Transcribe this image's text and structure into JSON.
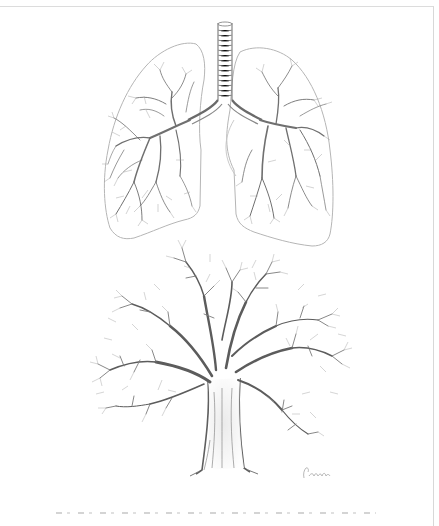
{
  "illustration": {
    "subjects": [
      "lungs",
      "tree"
    ],
    "style": "pencil sketch",
    "colors": {
      "background": "#ffffff",
      "stroke_dark": "#5a5a5a",
      "stroke_mid": "#8c8c8c",
      "stroke_light": "#bdbdbd",
      "frame": "#d8d8d8"
    }
  },
  "signature": {
    "label": ""
  },
  "caption": {
    "text": ""
  }
}
